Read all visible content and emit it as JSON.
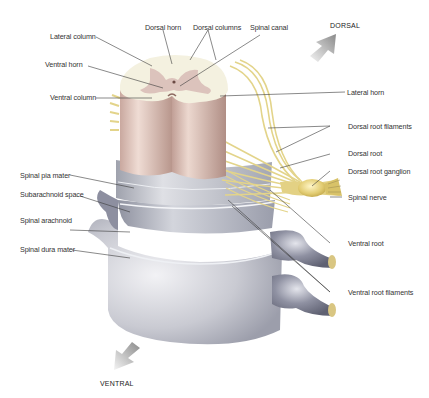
{
  "diagram": {
    "orientation": {
      "top_arrow": "DORSAL",
      "bottom_arrow": "VENTRAL"
    },
    "labels_left": [
      {
        "id": "lateral-column",
        "text": "Lateral column"
      },
      {
        "id": "ventral-horn",
        "text": "Ventral horn"
      },
      {
        "id": "ventral-column",
        "text": "Ventral column"
      },
      {
        "id": "spinal-pia-mater",
        "text": "Spinal pia mater"
      },
      {
        "id": "subarachnoid-space",
        "text": "Subarachnoid space"
      },
      {
        "id": "spinal-arachnoid",
        "text": "Spinal arachnoid"
      },
      {
        "id": "spinal-dura-mater",
        "text": "Spinal dura mater"
      }
    ],
    "labels_top": [
      {
        "id": "dorsal-horn",
        "text": "Dorsal horn"
      },
      {
        "id": "dorsal-columns",
        "text": "Dorsal columns"
      },
      {
        "id": "spinal-canal",
        "text": "Spinal canal"
      }
    ],
    "labels_right": [
      {
        "id": "lateral-horn",
        "text": "Lateral horn"
      },
      {
        "id": "dorsal-root-filaments",
        "text": "Dorsal root filaments"
      },
      {
        "id": "dorsal-root",
        "text": "Dorsal root"
      },
      {
        "id": "dorsal-root-ganglion",
        "text": "Dorsal root ganglion"
      },
      {
        "id": "spinal-nerve",
        "text": "Spinal nerve"
      },
      {
        "id": "ventral-root",
        "text": "Ventral root"
      },
      {
        "id": "ventral-root-filaments",
        "text": "Ventral root filaments"
      }
    ],
    "colors": {
      "white_matter": "#f4f1e2",
      "gray_matter": "#dcc3bf",
      "cord_column": "#d9b8ae",
      "pia": "#c9cbd1",
      "arachnoid": "#b9bcc6",
      "dura": "#c3c5cd",
      "nerve": "#e8d991",
      "ganglion": "#e6d27a",
      "root_sheath": "#8c8ea0",
      "leader_line": "#333333",
      "arrow": "#bdbdbd"
    }
  }
}
